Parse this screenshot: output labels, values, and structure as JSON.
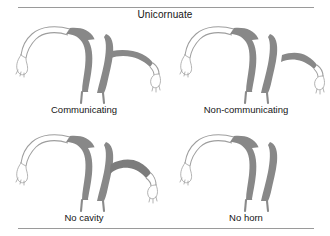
{
  "figure": {
    "title": "Unicornuate",
    "title_icon": "uterus-diagram",
    "colors": {
      "myometrium": "#888888",
      "tube_outline": "#9e9e9e",
      "cavity": "#ffffff",
      "rule": "#9a9a9a",
      "text": "#151515",
      "background": "#ffffff"
    },
    "rules": {
      "top_label": "top-divider",
      "bottom_label": "bottom-divider"
    },
    "panels": [
      {
        "id": "communicating",
        "label": "Communicating",
        "position": "top-left",
        "rudimentary_horn": "present",
        "horn_cavity": "present",
        "horn_connection": "communicating"
      },
      {
        "id": "non-communicating",
        "label": "Non-communicating",
        "position": "top-right",
        "rudimentary_horn": "present",
        "horn_cavity": "present",
        "horn_connection": "separated"
      },
      {
        "id": "no-cavity",
        "label": "No cavity",
        "position": "bottom-left",
        "rudimentary_horn": "present",
        "horn_cavity": "absent",
        "horn_connection": "attached-solid"
      },
      {
        "id": "no-horn",
        "label": "No horn",
        "position": "bottom-right",
        "rudimentary_horn": "absent",
        "horn_cavity": "absent",
        "horn_connection": "none"
      }
    ]
  }
}
